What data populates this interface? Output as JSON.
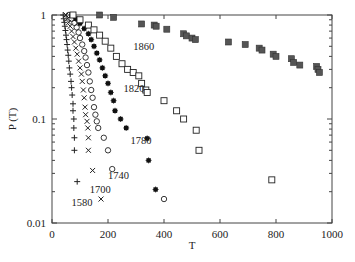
{
  "chart_data": {
    "type": "scatter",
    "title": "",
    "xlabel": "T",
    "ylabel": "P (T)",
    "xscale": "linear",
    "yscale": "log",
    "xlim": [
      0,
      1000
    ],
    "ylim": [
      0.01,
      1
    ],
    "xticks": [
      0,
      200,
      400,
      600,
      800,
      1000
    ],
    "xtick_labels": [
      "0",
      "200",
      "400",
      "600",
      "800",
      "1000"
    ],
    "yticks": [
      0.01,
      0.1,
      1
    ],
    "ytick_labels": [
      "0.01",
      "0.1",
      "1"
    ],
    "grid": false,
    "legend": "none (inline series labels)",
    "series": [
      {
        "name": "1580",
        "marker": "plus",
        "label_pos": [
          70,
          0.016
        ],
        "points": [
          [
            40,
            1
          ],
          [
            42,
            0.92
          ],
          [
            44,
            0.85
          ],
          [
            46,
            0.78
          ],
          [
            48,
            0.71
          ],
          [
            50,
            0.64
          ],
          [
            52,
            0.58
          ],
          [
            54,
            0.52
          ],
          [
            56,
            0.46
          ],
          [
            58,
            0.41
          ],
          [
            60,
            0.36
          ],
          [
            62,
            0.31
          ],
          [
            65,
            0.27
          ],
          [
            68,
            0.23
          ],
          [
            70,
            0.2
          ],
          [
            72,
            0.17
          ],
          [
            75,
            0.14
          ],
          [
            75,
            0.12
          ],
          [
            78,
            0.1
          ],
          [
            78,
            0.082
          ],
          [
            80,
            0.066
          ],
          [
            80,
            0.05
          ],
          [
            90,
            0.025
          ]
        ]
      },
      {
        "name": "1700",
        "marker": "x",
        "label_pos": [
          135,
          0.021
        ],
        "points": [
          [
            50,
            1
          ],
          [
            55,
            0.92
          ],
          [
            60,
            0.85
          ],
          [
            65,
            0.78
          ],
          [
            70,
            0.7
          ],
          [
            75,
            0.62
          ],
          [
            80,
            0.55
          ],
          [
            85,
            0.48
          ],
          [
            90,
            0.42
          ],
          [
            95,
            0.36
          ],
          [
            100,
            0.31
          ],
          [
            105,
            0.27
          ],
          [
            108,
            0.23
          ],
          [
            112,
            0.19
          ],
          [
            115,
            0.16
          ],
          [
            118,
            0.13
          ],
          [
            120,
            0.11
          ],
          [
            125,
            0.095
          ],
          [
            128,
            0.082
          ],
          [
            130,
            0.066
          ],
          [
            130,
            0.05
          ],
          [
            145,
            0.032
          ],
          [
            175,
            0.017
          ]
        ]
      },
      {
        "name": "1740",
        "marker": "circle",
        "label_pos": [
          200,
          0.029
        ],
        "points": [
          [
            60,
            1
          ],
          [
            70,
            0.92
          ],
          [
            80,
            0.84
          ],
          [
            88,
            0.76
          ],
          [
            95,
            0.68
          ],
          [
            100,
            0.6
          ],
          [
            108,
            0.52
          ],
          [
            115,
            0.45
          ],
          [
            120,
            0.39
          ],
          [
            125,
            0.33
          ],
          [
            130,
            0.28
          ],
          [
            135,
            0.23
          ],
          [
            140,
            0.19
          ],
          [
            145,
            0.16
          ],
          [
            150,
            0.13
          ],
          [
            155,
            0.11
          ],
          [
            160,
            0.095
          ],
          [
            165,
            0.082
          ],
          [
            185,
            0.066
          ],
          [
            200,
            0.05
          ],
          [
            215,
            0.033
          ],
          [
            400,
            0.017
          ]
        ]
      },
      {
        "name": "1780",
        "marker": "asterisk-square",
        "label_pos": [
          280,
          0.063
        ],
        "points": [
          [
            70,
            1
          ],
          [
            85,
            0.92
          ],
          [
            100,
            0.83
          ],
          [
            115,
            0.74
          ],
          [
            130,
            0.66
          ],
          [
            140,
            0.58
          ],
          [
            150,
            0.5
          ],
          [
            160,
            0.43
          ],
          [
            170,
            0.37
          ],
          [
            180,
            0.31
          ],
          [
            190,
            0.26
          ],
          [
            200,
            0.22
          ],
          [
            210,
            0.18
          ],
          [
            220,
            0.15
          ],
          [
            225,
            0.12
          ],
          [
            245,
            0.1
          ],
          [
            265,
            0.082
          ],
          [
            340,
            0.065
          ],
          [
            345,
            0.04
          ],
          [
            370,
            0.021
          ]
        ]
      },
      {
        "name": "1820",
        "marker": "square-open",
        "label_pos": [
          255,
          0.2
        ],
        "points": [
          [
            75,
            1
          ],
          [
            100,
            0.9
          ],
          [
            130,
            0.8
          ],
          [
            150,
            0.72
          ],
          [
            170,
            0.64
          ],
          [
            190,
            0.56
          ],
          [
            210,
            0.48
          ],
          [
            230,
            0.4
          ],
          [
            250,
            0.34
          ],
          [
            270,
            0.3
          ],
          [
            290,
            0.28
          ],
          [
            310,
            0.26
          ],
          [
            320,
            0.22
          ],
          [
            335,
            0.19
          ],
          [
            340,
            0.18
          ],
          [
            400,
            0.15
          ],
          [
            445,
            0.12
          ],
          [
            470,
            0.1
          ],
          [
            515,
            0.078
          ],
          [
            525,
            0.05
          ],
          [
            785,
            0.026
          ]
        ]
      },
      {
        "name": "1860",
        "marker": "square-filled",
        "label_pos": [
          290,
          0.5
        ],
        "points": [
          [
            170,
            1
          ],
          [
            220,
            0.95
          ],
          [
            320,
            0.82
          ],
          [
            365,
            0.8
          ],
          [
            372,
            0.78
          ],
          [
            410,
            0.73
          ],
          [
            470,
            0.66
          ],
          [
            480,
            0.63
          ],
          [
            500,
            0.6
          ],
          [
            512,
            0.58
          ],
          [
            630,
            0.55
          ],
          [
            690,
            0.52
          ],
          [
            740,
            0.48
          ],
          [
            750,
            0.46
          ],
          [
            790,
            0.42
          ],
          [
            800,
            0.4
          ],
          [
            855,
            0.38
          ],
          [
            863,
            0.35
          ],
          [
            885,
            0.33
          ],
          [
            945,
            0.32
          ],
          [
            950,
            0.3
          ],
          [
            955,
            0.28
          ]
        ]
      }
    ]
  }
}
